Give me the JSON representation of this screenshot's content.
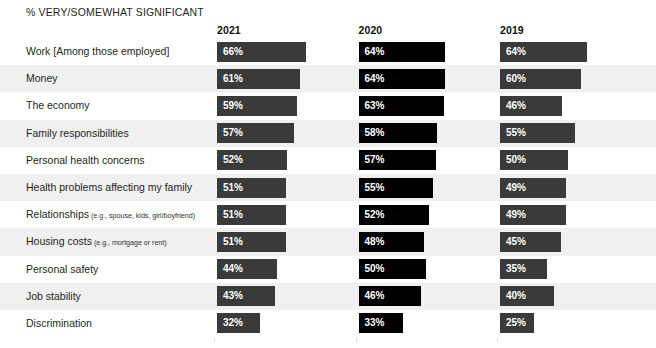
{
  "chart_data": {
    "type": "bar",
    "title": "% VERY/SOMEWHAT SIGNIFICANT",
    "subtitle": "",
    "xlabel": "",
    "ylabel": "",
    "xlim": [
      0,
      100
    ],
    "grid": false,
    "legend_position": "top-as-column-headers",
    "orientation": "horizontal",
    "value_suffix": "%",
    "categories": [
      "Work [Among those employed]",
      "Money",
      "The economy",
      "Family responsibilities",
      "Personal health concerns",
      "Health problems affecting my family",
      "Relationships",
      "Housing costs",
      "Personal safety",
      "Job stability",
      "Discrimination"
    ],
    "category_subtexts": [
      "",
      "",
      "",
      "",
      "",
      "",
      "(e.g., spouse, kids, girl/boyfriend)",
      "(e.g., mortgage or rent)",
      "",
      "",
      ""
    ],
    "series": [
      {
        "name": "2021",
        "color": "#3a3a3a",
        "values": [
          66,
          61,
          59,
          57,
          52,
          51,
          51,
          51,
          44,
          43,
          32
        ],
        "labels": [
          "66%",
          "61%",
          "59%",
          "57%",
          "52%",
          "51%",
          "51%",
          "51%",
          "44%",
          "43%",
          "32%"
        ]
      },
      {
        "name": "2020",
        "color": "#000000",
        "values": [
          64,
          64,
          63,
          58,
          57,
          55,
          52,
          48,
          50,
          46,
          33
        ],
        "labels": [
          "64%",
          "64%",
          "63%",
          "58%",
          "57%",
          "55%",
          "52%",
          "48%",
          "50%",
          "46%",
          "33%"
        ]
      },
      {
        "name": "2019",
        "color": "#3a3a3a",
        "values": [
          64,
          60,
          46,
          55,
          50,
          49,
          49,
          45,
          35,
          40,
          25
        ],
        "labels": [
          "64%",
          "60%",
          "46%",
          "55%",
          "50%",
          "49%",
          "49%",
          "45%",
          "35%",
          "40%",
          "25%"
        ]
      }
    ]
  },
  "layout": {
    "column_x": [
      217,
      358.5,
      500
    ],
    "px_per_percent": 1.355,
    "row_height": 27.2,
    "rows_top": 38,
    "stripe_color": "#f0f0f0",
    "background": "#ffffff"
  }
}
